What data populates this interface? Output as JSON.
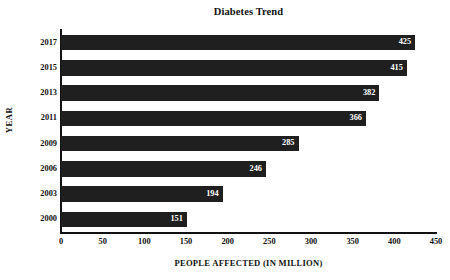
{
  "chart_data": {
    "type": "bar",
    "orientation": "horizontal",
    "title": "Diabetes Trend",
    "xlabel": "PEOPLE AFFECTED (IN MILLION)",
    "ylabel": "YEAR",
    "categories": [
      "2017",
      "2015",
      "2013",
      "2011",
      "2009",
      "2006",
      "2003",
      "2000"
    ],
    "values": [
      425,
      415,
      382,
      366,
      285,
      246,
      194,
      151
    ],
    "data_labels": [
      "425",
      "415",
      "382",
      "366",
      "285",
      "246",
      "194",
      "151"
    ],
    "xlim": [
      0,
      450
    ],
    "xticks": [
      0,
      50,
      100,
      150,
      200,
      250,
      300,
      350,
      400,
      450
    ],
    "xtick_labels": [
      "0",
      "50",
      "100",
      "150",
      "200",
      "250",
      "300",
      "350",
      "400",
      "450"
    ],
    "grid": false,
    "legend": null,
    "bar_color": "#1f1f1f",
    "data_label_color": "#ffffff",
    "axis_color": "#111111",
    "background_color": "#ffffff"
  }
}
